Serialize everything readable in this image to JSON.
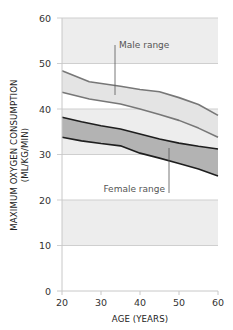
{
  "chart_data": {
    "type": "area",
    "title": "",
    "xlabel": "AGE (YEARS)",
    "ylabel": "MAXIMUM OXYGEN CONSUMPTION",
    "ylabel_units": "(ML/KG/MIN)",
    "xlim": [
      20,
      60
    ],
    "ylim": [
      0,
      60
    ],
    "x_ticks": [
      20,
      30,
      40,
      50,
      60
    ],
    "y_ticks": [
      0,
      10,
      20,
      30,
      40,
      50,
      60
    ],
    "grid": true,
    "shaded_bands": [
      [
        10,
        20
      ],
      [
        30,
        40
      ],
      [
        50,
        60
      ]
    ],
    "series": [
      {
        "name": "Male range",
        "fill": "#e4e4e4",
        "stroke": "#777777",
        "x": [
          20,
          27,
          35,
          40,
          45,
          50,
          55,
          60
        ],
        "upper": [
          48.4,
          46.0,
          45.0,
          44.3,
          43.8,
          42.5,
          41.0,
          38.6
        ],
        "lower": [
          43.7,
          42.2,
          41.1,
          40.0,
          38.8,
          37.5,
          35.8,
          33.8
        ]
      },
      {
        "name": "Female range",
        "fill": "#b3b3b3",
        "stroke": "#1e1e1e",
        "x": [
          20,
          25,
          30,
          35,
          40,
          45,
          50,
          55,
          60
        ],
        "upper": [
          38.2,
          37.2,
          36.3,
          35.6,
          34.5,
          33.4,
          32.5,
          31.8,
          31.2
        ],
        "lower": [
          33.8,
          33.0,
          32.4,
          31.9,
          30.3,
          29.2,
          28.0,
          26.8,
          25.3
        ]
      }
    ],
    "annotations": [
      {
        "text": "Male range",
        "x": 30,
        "y": 50.5
      },
      {
        "text": "Female range",
        "x": 34,
        "y": 21.5
      }
    ]
  },
  "labels": {
    "male_range": "Male range",
    "female_range": "Female range",
    "x_title": "AGE (YEARS)",
    "y_title_line1": "MAXIMUM OXYGEN CONSUMPTION",
    "y_title_line2": "(ML/KG/MIN)"
  }
}
